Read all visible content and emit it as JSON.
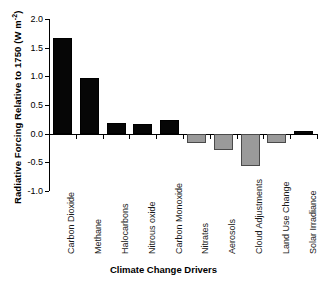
{
  "chart_data": {
    "type": "bar",
    "title": "",
    "xlabel": "Climate Change Drivers",
    "ylabel": "Radiative Forcing Relative to 1750 (W m",
    "ylabel_sup": "-2",
    "ylabel_suffix": ")",
    "ylabel_full": "Radiative Forcing Relative to 1750 (W m-2)",
    "ylim": [
      -1.0,
      2.0
    ],
    "yticks": [
      2.0,
      1.5,
      1.0,
      0.5,
      0.0,
      -0.5,
      -1.0
    ],
    "ytick_labels": [
      "2.0",
      "1.5",
      "1.0",
      "0.5",
      "0.0",
      "-0.5",
      "-1.0"
    ],
    "grid": false,
    "legend": "none",
    "categories": [
      "Carbon Dioxide",
      "Methane",
      "Halocarbons",
      "Nitrous oxide",
      "Carbon Monoxide",
      "Nitrates",
      "Aerosols",
      "Cloud Adjustments",
      "Land Use Change",
      "Solar Irradiance"
    ],
    "values": [
      1.66,
      0.97,
      0.18,
      0.17,
      0.23,
      -0.16,
      -0.29,
      -0.57,
      -0.17,
      0.05
    ],
    "bar_colors": [
      "#060606",
      "#060606",
      "#060606",
      "#060606",
      "#060606",
      "#9a9a9a",
      "#9a9a9a",
      "#9a9a9a",
      "#9a9a9a",
      "#060606"
    ]
  },
  "colors": {
    "positive_bar": "#060606",
    "negative_bar": "#9a9a9a",
    "axis": "#000000",
    "background": "#ffffff"
  }
}
